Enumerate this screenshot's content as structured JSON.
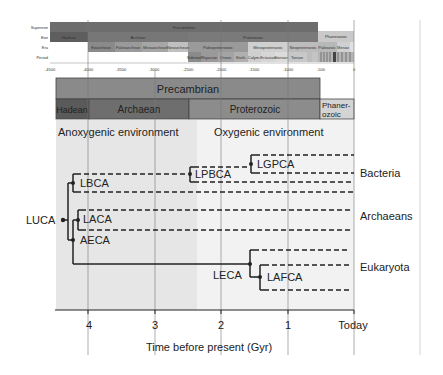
{
  "mini_timeline": {
    "row_labels": [
      "Supereon",
      "Eon",
      "Era",
      "Period"
    ],
    "supereon": [
      {
        "label": "Precambrian",
        "from": -4540,
        "to": -541,
        "color": "#6d6d6d"
      },
      {
        "label": "Phanerozoic",
        "from": -541,
        "to": 0,
        "color": "#c9c9c9"
      }
    ],
    "eons": [
      {
        "label": "Hadean",
        "from": -4540,
        "to": -4000,
        "color": "#5e5e5e"
      },
      {
        "label": "Archean",
        "from": -4000,
        "to": -2500,
        "color": "#777777"
      },
      {
        "label": "Proterozoic",
        "from": -2500,
        "to": -541,
        "color": "#7a7a7a"
      },
      {
        "label": "Phanerozoic",
        "from": -541,
        "to": 0,
        "color": "#c9c9c9"
      }
    ],
    "eras": [
      {
        "label": "Eoarchean",
        "from": -4000,
        "to": -3600
      },
      {
        "label": "Paleoarchean",
        "from": -3600,
        "to": -3200
      },
      {
        "label": "Mesoarchean",
        "from": -3200,
        "to": -2800
      },
      {
        "label": "Neoarchean",
        "from": -2800,
        "to": -2500
      },
      {
        "label": "Paleoproterozoic",
        "from": -2500,
        "to": -1600
      },
      {
        "label": "Mesoproterozoic",
        "from": -1600,
        "to": -1000
      },
      {
        "label": "Neoproterozoic",
        "from": -1000,
        "to": -541
      },
      {
        "label": "Paleozoic",
        "from": -541,
        "to": -252
      },
      {
        "label": "Mesoz",
        "from": -252,
        "to": -66
      },
      {
        "label": "C",
        "from": -66,
        "to": 0
      }
    ],
    "periods": [
      {
        "label": "Siderian",
        "from": -2500,
        "to": -2300
      },
      {
        "label": "Rhyacian",
        "from": -2300,
        "to": -2050
      },
      {
        "label": "Orosir.",
        "from": -2050,
        "to": -1800
      },
      {
        "label": "Stath.",
        "from": -1800,
        "to": -1600
      },
      {
        "label": "Calym.",
        "from": -1600,
        "to": -1400
      },
      {
        "label": "Ectasian",
        "from": -1400,
        "to": -1200
      },
      {
        "label": "Stenian",
        "from": -1200,
        "to": -1000
      },
      {
        "label": "Tonian",
        "from": -1000,
        "to": -720
      },
      {
        "label": "Cr.",
        "from": -720,
        "to": -635
      },
      {
        "label": "Ed.",
        "from": -635,
        "to": -541
      }
    ],
    "ticks": [
      "-4500",
      "-4000",
      "-3500",
      "-3000",
      "-2500",
      "-2000",
      "-1500",
      "-1000",
      "-500",
      "0"
    ]
  },
  "eon_bars": {
    "precambrian": "Precambrian",
    "hadean": "Hadean",
    "archaean": "Archaean",
    "proterozoic": "Proterozoic",
    "phanerozoic_1": "Phaner-",
    "phanerozoic_2": "ozoic"
  },
  "environments": {
    "anoxygenic": "Anoxygenic environment",
    "oxygenic": "Oxygenic environment"
  },
  "nodes": {
    "luca": "LUCA",
    "lbca": "LBCA",
    "lpbca": "LPBCA",
    "lgpca": "LGPCA",
    "laca": "LACA",
    "aeca": "AECA",
    "leca": "LECA",
    "lafca": "LAFCA"
  },
  "groups": {
    "bacteria": "Bacteria",
    "archaeans": "Archaeans",
    "eukaryota": "Eukaryota"
  },
  "axis": {
    "ticks": [
      "4",
      "3",
      "2",
      "1",
      "Today"
    ],
    "title": "Time before present (Gyr)"
  },
  "colors": {
    "anoxic_bg": "#e6e6e6",
    "oxic_bg": "#f2f2f2",
    "precambrian": "#8a8a8a",
    "hadean": "#5a5a5a",
    "archaean": "#6e6e6e",
    "proterozoic": "#8c8c8c",
    "phanerozoic": "#d4d4d4",
    "line": "#222222"
  }
}
